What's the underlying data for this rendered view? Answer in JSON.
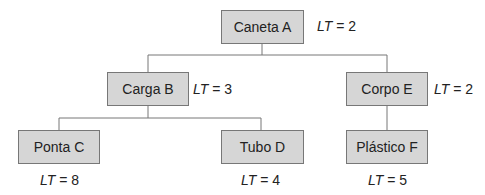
{
  "nodes": [
    {
      "id": "A",
      "label": "Caneta A",
      "lt_var": "LT",
      "lt_value": "= 2"
    },
    {
      "id": "B",
      "label": "Carga B",
      "lt_var": "LT",
      "lt_value": "= 3"
    },
    {
      "id": "E",
      "label": "Corpo E",
      "lt_var": "LT",
      "lt_value": "= 2"
    },
    {
      "id": "C",
      "label": "Ponta C",
      "lt_var": "LT",
      "lt_value": "= 8"
    },
    {
      "id": "D",
      "label": "Tubo D",
      "lt_var": "LT",
      "lt_value": "= 4"
    },
    {
      "id": "F",
      "label": "Plástico F",
      "lt_var": "LT",
      "lt_value": "= 5"
    }
  ],
  "edges": [
    [
      "A",
      "B"
    ],
    [
      "A",
      "E"
    ],
    [
      "B",
      "C"
    ],
    [
      "B",
      "D"
    ],
    [
      "E",
      "F"
    ]
  ]
}
